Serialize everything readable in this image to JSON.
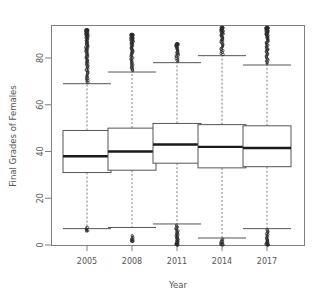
{
  "chart_data": {
    "type": "box",
    "title": "",
    "xlabel": "Year",
    "ylabel": "Final Grades of Females",
    "categories": [
      "2005",
      "2008",
      "2011",
      "2014",
      "2017"
    ],
    "xtick_labels": [
      "2005",
      "2008",
      "2011",
      "2014",
      "2017"
    ],
    "ytick_labels": [
      "0",
      "20",
      "40",
      "60",
      "80"
    ],
    "ytick_values": [
      0,
      20,
      40,
      60,
      80
    ],
    "ylim": [
      -2,
      95
    ],
    "grid": false,
    "legend": null,
    "box_style": {
      "box_border_color": "#555555",
      "box_fill_color": "#ffffff",
      "median_color": "#1a1a1a",
      "whisker_style": "dashed",
      "whisker_color": "#7a7a7a",
      "outlier_marker": "circle",
      "outlier_color": "#2b2b2b",
      "frame_color": "#808080"
    },
    "boxes": [
      {
        "category": "2005",
        "q1": 31.0,
        "median": 38.0,
        "q3": 49.0,
        "whisker_low": 7.0,
        "whisker_high": 69.0,
        "outliers_high_range": [
          69.5,
          92.0
        ],
        "outliers_low_range": [
          6.0,
          7.5
        ],
        "outlier_top_isolated": 92.0
      },
      {
        "category": "2008",
        "q1": 32.0,
        "median": 40.0,
        "q3": 50.0,
        "whisker_low": 7.5,
        "whisker_high": 74.0,
        "outliers_high_range": [
          74.5,
          90.0
        ],
        "outliers_low_range": [
          1.5,
          4.0
        ],
        "outlier_top_isolated": 90.0
      },
      {
        "category": "2011",
        "q1": 35.0,
        "median": 43.0,
        "q3": 52.0,
        "whisker_low": 9.0,
        "whisker_high": 78.0,
        "outliers_high_range": [
          78.5,
          86.0
        ],
        "outliers_low_range": [
          0.0,
          8.5
        ],
        "outlier_top_isolated": 86.0
      },
      {
        "category": "2014",
        "q1": 33.0,
        "median": 42.0,
        "q3": 51.5,
        "whisker_low": 3.0,
        "whisker_high": 81.0,
        "outliers_high_range": [
          81.5,
          93.0
        ],
        "outliers_low_range": [
          0.0,
          2.5
        ],
        "outlier_top_isolated": 93.0
      },
      {
        "category": "2017",
        "q1": 33.5,
        "median": 41.5,
        "q3": 51.0,
        "whisker_low": 7.0,
        "whisker_high": 77.0,
        "outliers_high_range": [
          77.5,
          93.0
        ],
        "outliers_low_range": [
          0.0,
          6.5
        ],
        "outlier_top_isolated": 93.0
      }
    ]
  },
  "axes": {
    "y_title": "Final Grades of Females",
    "x_title": "Year"
  }
}
